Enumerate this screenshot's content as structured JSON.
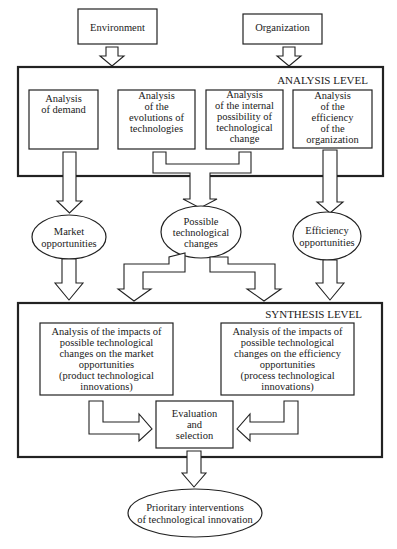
{
  "diagram": {
    "inputs": {
      "environment": "Environment",
      "organization": "Organization"
    },
    "analysis_level": {
      "title": "ANALYSIS LEVEL",
      "boxes": [
        {
          "lines": [
            "Analysis",
            "of demand"
          ]
        },
        {
          "lines": [
            "Analysis",
            "of the",
            "evolutions of",
            "technologies"
          ]
        },
        {
          "lines": [
            "Analysis",
            "of the internal",
            "possibility of",
            "technological",
            "change"
          ]
        },
        {
          "lines": [
            "Analysis",
            "of the",
            "efficiency",
            "of the",
            "organization"
          ]
        }
      ]
    },
    "intermediate": [
      {
        "lines": [
          "Market",
          "opportunities"
        ]
      },
      {
        "lines": [
          "Possible",
          "technological",
          "changes"
        ]
      },
      {
        "lines": [
          "Efficiency",
          "opportunities"
        ]
      }
    ],
    "synthesis_level": {
      "title": "SYNTHESIS LEVEL",
      "left_box": {
        "lines": [
          "Analysis of the impacts of",
          "possible technological",
          "changes on the market",
          "opportunities",
          "(product technological",
          "innovations)"
        ]
      },
      "right_box": {
        "lines": [
          "Analysis of the impacts of",
          "possible technological",
          "changes on the efficiency",
          "opportunities",
          "(process technological",
          "innovations)"
        ]
      },
      "evaluation": {
        "lines": [
          "Evaluation",
          "and",
          "selection"
        ]
      }
    },
    "output": {
      "lines": [
        "Prioritary interventions",
        "of technological innovation"
      ]
    }
  }
}
